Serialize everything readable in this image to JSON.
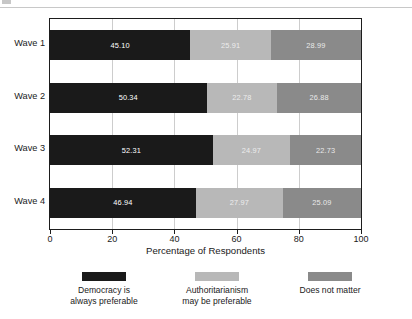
{
  "chart_data": {
    "type": "bar",
    "orientation": "horizontal",
    "stacked": true,
    "normalized_to_percent": true,
    "title": "",
    "xlabel": "Percentage of Respondents",
    "ylabel": "",
    "xlim": [
      0,
      100
    ],
    "xticks": [
      0,
      20,
      40,
      60,
      80,
      100
    ],
    "xtick_labels": [
      "0",
      "20",
      "40",
      "60",
      "80",
      "100"
    ],
    "grid": "vertical",
    "legend_position": "bottom",
    "categories": [
      "Wave 1",
      "Wave 2",
      "Wave 3",
      "Wave 4"
    ],
    "series": [
      {
        "name": "Democracy is always preferable",
        "name_line1": "Democracy is",
        "name_line2": "always preferable",
        "color": "#1a1a1a",
        "values": [
          45.1,
          50.34,
          52.31,
          46.94
        ],
        "labels": [
          "45.10",
          "50.34",
          "52.31",
          "46.94"
        ]
      },
      {
        "name": "Authoritarianism may be preferable",
        "name_line1": "Authoritarianism",
        "name_line2": "may be preferable",
        "color": "#b8b8b8",
        "values": [
          25.91,
          22.78,
          24.97,
          27.97
        ],
        "labels": [
          "25.91",
          "22.78",
          "24.97",
          "27.97"
        ]
      },
      {
        "name": "Does not matter",
        "name_line1": "Does not matter",
        "name_line2": "",
        "color": "#8a8a8a",
        "values": [
          28.99,
          26.88,
          22.73,
          25.09
        ],
        "labels": [
          "28.99",
          "26.88",
          "22.73",
          "25.09"
        ]
      }
    ]
  },
  "axis": {
    "x_title": "Percentage of Respondents",
    "ticks": [
      "0",
      "20",
      "40",
      "60",
      "80",
      "100"
    ]
  },
  "categories": [
    "Wave 1",
    "Wave 2",
    "Wave 3",
    "Wave 4"
  ],
  "legend": [
    {
      "line1": "Democracy is",
      "line2": "always preferable",
      "color": "#1a1a1a"
    },
    {
      "line1": "Authoritarianism",
      "line2": "may be preferable",
      "color": "#b8b8b8"
    },
    {
      "line1": "Does not matter",
      "line2": "",
      "color": "#8a8a8a"
    }
  ],
  "colors": {
    "series_1": "#1a1a1a",
    "series_2": "#b8b8b8",
    "series_3": "#8a8a8a",
    "frame": "#1d1d1d",
    "grid": "#cdcdcd",
    "background": "#ffffff"
  }
}
